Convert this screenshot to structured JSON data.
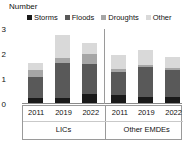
{
  "axis_title": "Number",
  "legend": [
    {
      "label": "Storms",
      "color": "#1a1a1a",
      "name": "legend-item-storms"
    },
    {
      "label": "Floods",
      "color": "#595959",
      "name": "legend-item-floods"
    },
    {
      "label": "Droughts",
      "color": "#a6a6a6",
      "name": "legend-item-droughts"
    },
    {
      "label": "Other",
      "color": "#d9d9d9",
      "name": "legend-item-other"
    }
  ],
  "yticks": [
    "0",
    "1",
    "2",
    "3"
  ],
  "groups": [
    {
      "label": "LICs",
      "years": [
        "2011",
        "2019",
        "2022"
      ]
    },
    {
      "label": "Other EMDEs",
      "years": [
        "2011",
        "2019",
        "2022"
      ]
    }
  ],
  "chart_data": {
    "type": "bar",
    "stacked": true,
    "title": "",
    "xlabel": "",
    "ylabel": "Number",
    "ylim": [
      0,
      3
    ],
    "yticks": [
      0,
      1,
      2,
      3
    ],
    "grid": false,
    "legend_position": "top",
    "categories": [
      "LICs 2011",
      "LICs 2019",
      "LICs 2022",
      "Other EMDEs 2011",
      "Other EMDEs 2019",
      "Other EMDEs 2022"
    ],
    "group_labels": [
      "LICs",
      "Other EMDEs"
    ],
    "years": [
      "2011",
      "2019",
      "2022",
      "2011",
      "2019",
      "2022"
    ],
    "series": [
      {
        "name": "Storms",
        "color": "#1a1a1a",
        "values": [
          0.25,
          0.25,
          0.4,
          0.35,
          0.3,
          0.3
        ]
      },
      {
        "name": "Floods",
        "color": "#595959",
        "values": [
          0.85,
          1.4,
          1.2,
          0.95,
          1.2,
          1.05
        ]
      },
      {
        "name": "Droughts",
        "color": "#a6a6a6",
        "values": [
          0.25,
          0.2,
          0.4,
          0.1,
          0.05,
          0.1
        ]
      },
      {
        "name": "Other",
        "color": "#d9d9d9",
        "values": [
          0.3,
          0.9,
          0.45,
          0.55,
          0.6,
          0.45
        ]
      }
    ],
    "totals": [
      1.65,
      2.75,
      2.45,
      1.95,
      2.15,
      1.9
    ]
  }
}
